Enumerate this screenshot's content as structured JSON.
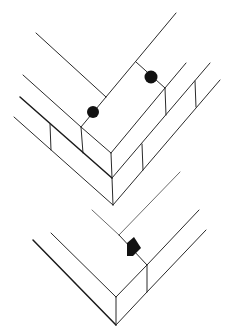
{
  "diagram": {
    "title": "",
    "figures": [
      {
        "id": "upper-brick-corner",
        "markers": [
          {
            "type": "circle"
          },
          {
            "type": "circle"
          }
        ]
      },
      {
        "id": "lower-slab-corner",
        "markers": [
          {
            "type": "diamond"
          }
        ]
      }
    ],
    "colors": {
      "line": "#2a2a2a",
      "marker": "#111111",
      "background": "#ffffff"
    }
  }
}
